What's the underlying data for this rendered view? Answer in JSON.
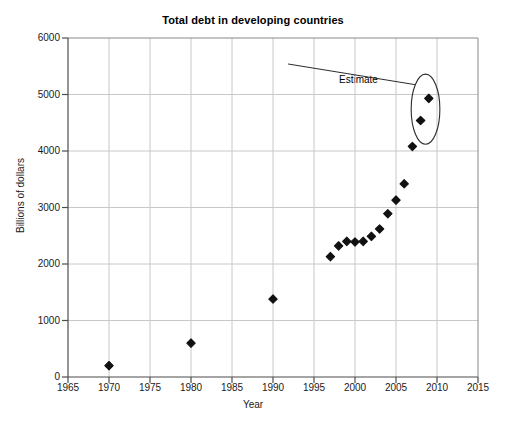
{
  "chart_data": {
    "type": "scatter",
    "title": "Total debt in developing countries",
    "xlabel": "Year",
    "ylabel": "Billions of dollars",
    "xlim": [
      1965,
      2015
    ],
    "ylim": [
      0,
      6000
    ],
    "xticks": [
      "1965",
      "1970",
      "1975",
      "1980",
      "1985",
      "1990",
      "1995",
      "2000",
      "2005",
      "2010",
      "2015"
    ],
    "yticks": [
      "0",
      "1000",
      "2000",
      "3000",
      "4000",
      "5000",
      "6000"
    ],
    "grid": true,
    "legend": "none",
    "marker": "diamond",
    "marker_color": "#111111",
    "series": [
      {
        "name": "Total debt",
        "x": [
          1970,
          1980,
          1990,
          1997,
          1998,
          1999,
          2000,
          2001,
          2002,
          2003,
          2004,
          2005,
          2006,
          2007,
          2008,
          2009
        ],
        "y": [
          200,
          600,
          1380,
          2130,
          2320,
          2400,
          2390,
          2400,
          2490,
          2620,
          2890,
          3130,
          3420,
          4080,
          4540,
          4930
        ]
      }
    ],
    "annotations": [
      {
        "text": "Estimate",
        "type": "callout-ellipse",
        "label_x": 1991.6,
        "label_y": 5540,
        "ellipse_center_x": 2008.6,
        "ellipse_center_y": 4740,
        "ellipse_rx_years": 1.75,
        "ellipse_ry_value": 620,
        "points_circled": [
          2008,
          2009
        ]
      }
    ]
  },
  "colors": {
    "axis": "#4d4d4d",
    "grid": "#c8c8c8",
    "marker": "#111111",
    "text": "#1a1a1a",
    "background": "#ffffff"
  }
}
